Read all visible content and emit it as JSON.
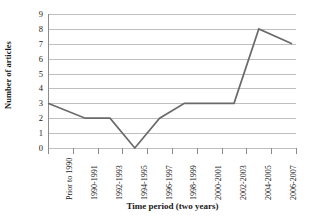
{
  "chart_data": {
    "type": "line",
    "title": "",
    "xlabel": "Time period (two years)",
    "ylabel": "Number of articles",
    "categories": [
      "Prior to 1990",
      "1990-1991",
      "1992-1993",
      "1994-1995",
      "1996-1997",
      "1998-1999",
      "2000-2001",
      "2002-2003",
      "2004-2005",
      "2006-2007"
    ],
    "values": [
      3,
      2,
      2,
      0,
      2,
      3,
      3,
      3,
      8,
      7
    ],
    "series": [
      {
        "name": "Number of articles",
        "values": [
          3,
          2,
          2,
          0,
          2,
          3,
          3,
          3,
          8,
          7
        ]
      }
    ],
    "ylim": [
      0,
      9
    ],
    "ytick_labels": [
      "9",
      "8",
      "7",
      "6",
      "5",
      "4",
      "3",
      "2",
      "1",
      "0"
    ],
    "ytick_values": [
      9,
      8,
      7,
      6,
      5,
      4,
      3,
      2,
      1,
      0
    ],
    "grid": true,
    "grid_orientation": "horizontal",
    "legend": false,
    "legend_position": "none",
    "markers": false,
    "colors": {
      "line": "#6a6a6a",
      "grid": "#bfbfbf",
      "axis": "#8c8c8c",
      "background": "#ffffff",
      "text": "#1a1a1a"
    }
  }
}
